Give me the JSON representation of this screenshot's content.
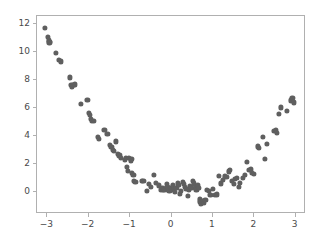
{
  "chart_data": {
    "type": "scatter",
    "title": "",
    "xlabel": "",
    "ylabel": "",
    "xlim": [
      -3.25,
      3.25
    ],
    "ylim": [
      -1.6,
      12.6
    ],
    "grid": false,
    "legend": null,
    "marker": {
      "color": "#5f5f5f",
      "shape": "circle",
      "size_px": 5.2
    },
    "xticks": [
      -3,
      -2,
      -1,
      0,
      1,
      2,
      3
    ],
    "xtick_labels": [
      "−3",
      "−2",
      "−1",
      "0",
      "1",
      "2",
      "3"
    ],
    "yticks": [
      0,
      2,
      4,
      6,
      8,
      10,
      12
    ],
    "ytick_labels": [
      "0",
      "2",
      "4",
      "6",
      "8",
      "10",
      "12"
    ],
    "series": [
      {
        "name": "samples",
        "points": [
          [
            -3.05,
            11.75
          ],
          [
            -2.99,
            11.1
          ],
          [
            -2.97,
            10.85
          ],
          [
            -2.95,
            10.7
          ],
          [
            -2.93,
            10.75
          ],
          [
            -2.8,
            9.95
          ],
          [
            -2.72,
            9.45
          ],
          [
            -2.68,
            9.35
          ],
          [
            -2.45,
            8.2
          ],
          [
            -2.42,
            7.65
          ],
          [
            -2.4,
            7.55
          ],
          [
            -2.37,
            7.65
          ],
          [
            -2.34,
            7.7
          ],
          [
            -2.18,
            6.3
          ],
          [
            -2.03,
            6.6
          ],
          [
            -2.0,
            5.65
          ],
          [
            -1.97,
            5.5
          ],
          [
            -1.95,
            5.2
          ],
          [
            -1.92,
            5.05
          ],
          [
            -1.88,
            5.1
          ],
          [
            -1.78,
            3.95
          ],
          [
            -1.75,
            3.8
          ],
          [
            -1.62,
            4.45
          ],
          [
            -1.55,
            4.15
          ],
          [
            -1.48,
            3.35
          ],
          [
            -1.45,
            3.2
          ],
          [
            -1.42,
            3.0
          ],
          [
            -1.4,
            2.95
          ],
          [
            -1.35,
            3.6
          ],
          [
            -1.3,
            2.7
          ],
          [
            -1.26,
            2.6
          ],
          [
            -1.22,
            2.45
          ],
          [
            -1.12,
            2.3
          ],
          [
            -1.1,
            2.45
          ],
          [
            -1.08,
            1.8
          ],
          [
            -1.05,
            1.5
          ],
          [
            -1.02,
            2.45
          ],
          [
            -0.99,
            2.25
          ],
          [
            -0.97,
            2.35
          ],
          [
            -0.95,
            1.35
          ],
          [
            -0.92,
            1.2
          ],
          [
            -0.9,
            0.75
          ],
          [
            -0.87,
            0.7
          ],
          [
            -0.72,
            0.75
          ],
          [
            -0.68,
            0.8
          ],
          [
            -0.6,
            0.05
          ],
          [
            -0.55,
            0.55
          ],
          [
            -0.5,
            0.35
          ],
          [
            -0.42,
            1.2
          ],
          [
            -0.38,
            0.65
          ],
          [
            -0.3,
            0.45
          ],
          [
            -0.26,
            0.15
          ],
          [
            -0.22,
            0.25
          ],
          [
            -0.2,
            0.1
          ],
          [
            -0.17,
            0.15
          ],
          [
            -0.12,
            0.55
          ],
          [
            -0.1,
            0.35
          ],
          [
            -0.08,
            0.1
          ],
          [
            -0.05,
            0.05
          ],
          [
            -0.02,
            0.3
          ],
          [
            0.0,
            0.15
          ],
          [
            0.03,
            0.45
          ],
          [
            0.06,
            0.2
          ],
          [
            0.09,
            0.0
          ],
          [
            0.12,
            0.25
          ],
          [
            0.15,
            0.6
          ],
          [
            0.18,
            0.5
          ],
          [
            0.2,
            -0.15
          ],
          [
            0.23,
            0.05
          ],
          [
            0.27,
            0.7
          ],
          [
            0.3,
            0.55
          ],
          [
            0.33,
            0.35
          ],
          [
            0.36,
            0.2
          ],
          [
            0.39,
            -0.3
          ],
          [
            0.42,
            0.1
          ],
          [
            0.45,
            0.4
          ],
          [
            0.48,
            0.25
          ],
          [
            0.52,
            0.75
          ],
          [
            0.55,
            0.6
          ],
          [
            0.58,
            0.35
          ],
          [
            0.6,
            0.1
          ],
          [
            0.63,
            0.45
          ],
          [
            0.66,
            0.3
          ],
          [
            0.68,
            -0.55
          ],
          [
            0.7,
            -0.75
          ],
          [
            0.72,
            -0.85
          ],
          [
            0.75,
            -0.7
          ],
          [
            0.78,
            -0.8
          ],
          [
            0.82,
            -0.6
          ],
          [
            0.86,
            0.15
          ],
          [
            0.9,
            0.05
          ],
          [
            0.94,
            -0.25
          ],
          [
            1.0,
            0.2
          ],
          [
            1.05,
            -0.25
          ],
          [
            1.1,
            -0.2
          ],
          [
            1.14,
            1.15
          ],
          [
            1.2,
            0.6
          ],
          [
            1.25,
            0.85
          ],
          [
            1.3,
            1.1
          ],
          [
            1.34,
            1.05
          ],
          [
            1.38,
            1.45
          ],
          [
            1.42,
            1.55
          ],
          [
            1.45,
            0.75
          ],
          [
            1.5,
            0.55
          ],
          [
            1.54,
            0.9
          ],
          [
            1.58,
            1.0
          ],
          [
            1.62,
            0.35
          ],
          [
            1.66,
            0.65
          ],
          [
            1.72,
            1.0
          ],
          [
            1.78,
            1.2
          ],
          [
            1.82,
            2.15
          ],
          [
            1.88,
            1.55
          ],
          [
            1.92,
            1.6
          ],
          [
            1.95,
            1.35
          ],
          [
            2.0,
            1.3
          ],
          [
            2.08,
            3.25
          ],
          [
            2.12,
            3.15
          ],
          [
            2.2,
            3.9
          ],
          [
            2.25,
            2.35
          ],
          [
            2.3,
            3.45
          ],
          [
            2.48,
            4.35
          ],
          [
            2.52,
            4.4
          ],
          [
            2.55,
            4.2
          ],
          [
            2.6,
            5.55
          ],
          [
            2.65,
            6.05
          ],
          [
            2.78,
            5.8
          ],
          [
            2.88,
            6.55
          ],
          [
            2.92,
            6.7
          ],
          [
            2.95,
            6.4
          ]
        ]
      }
    ]
  }
}
